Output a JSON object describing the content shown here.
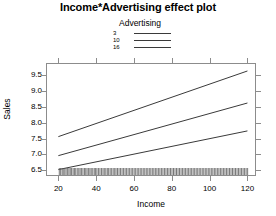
{
  "chart_data": {
    "type": "line",
    "title": "Income*Advertising effect plot",
    "xlabel": "Income",
    "ylabel": "Sales",
    "xlim": [
      14,
      124
    ],
    "ylim": [
      6.35,
      9.85
    ],
    "xticks": [
      20,
      40,
      60,
      80,
      100,
      120
    ],
    "yticks": [
      6.5,
      7.0,
      7.5,
      8.0,
      8.5,
      9.0,
      9.5
    ],
    "grid": false,
    "legend": {
      "title": "Advertising",
      "position": "top-center",
      "entries": [
        "3",
        "10",
        "16"
      ]
    },
    "x": [
      20,
      120
    ],
    "series": [
      {
        "name": "3",
        "values": [
          6.52,
          7.74
        ]
      },
      {
        "name": "10",
        "values": [
          6.96,
          8.62
        ]
      },
      {
        "name": "16",
        "values": [
          7.56,
          9.63
        ]
      }
    ],
    "rug": {
      "axis": "x",
      "values": [
        20.5,
        21.2,
        22.0,
        22.6,
        23.4,
        24.1,
        24.9,
        25.6,
        26.3,
        27.0,
        27.8,
        28.5,
        29.2,
        30.0,
        30.8,
        31.5,
        32.2,
        33.0,
        33.8,
        34.5,
        35.2,
        36.0,
        36.7,
        37.4,
        38.2,
        39.0,
        39.7,
        40.4,
        41.2,
        42.0,
        42.8,
        43.6,
        44.3,
        45.1,
        45.9,
        46.6,
        47.4,
        48.2,
        49.0,
        49.8,
        50.5,
        51.3,
        52.1,
        52.9,
        53.7,
        54.5,
        55.3,
        56.1,
        56.9,
        57.7,
        58.5,
        59.3,
        60.1,
        60.9,
        61.7,
        62.5,
        63.3,
        64.1,
        64.9,
        65.7,
        66.5,
        67.3,
        68.1,
        68.9,
        69.7,
        70.5,
        71.3,
        72.1,
        72.9,
        73.7,
        74.5,
        75.3,
        76.1,
        76.9,
        77.7,
        78.5,
        79.3,
        80.1,
        80.9,
        81.7,
        82.5,
        83.3,
        84.1,
        84.9,
        85.7,
        86.5,
        87.3,
        88.1,
        88.9,
        89.7,
        90.5,
        91.3,
        92.1,
        92.9,
        93.7,
        94.5,
        95.3,
        96.1,
        96.9,
        97.7,
        98.5,
        99.3,
        100.1,
        100.9,
        101.7,
        102.5,
        103.3,
        104.1,
        104.9,
        105.7,
        106.5,
        107.3,
        108.1,
        108.9,
        109.7,
        110.5,
        111.3,
        112.1,
        112.9,
        113.7,
        114.5,
        115.3,
        116.1,
        116.9,
        117.7,
        118.5,
        119.3,
        120.1
      ]
    },
    "colors": {
      "line": "#3a3a3a",
      "frame": "#8c8c8c",
      "rug": "#555555",
      "background": "#ffffff",
      "text": "#000000"
    }
  }
}
